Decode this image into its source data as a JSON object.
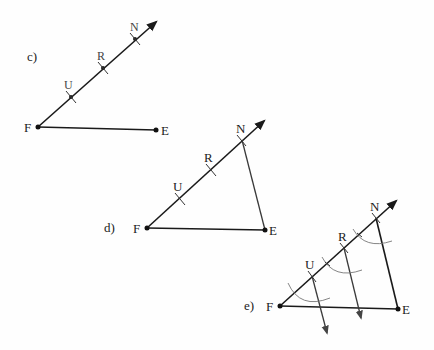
{
  "diagrams": [
    {
      "id": "c",
      "label": "c)",
      "points": {
        "F": "F",
        "E": "E",
        "U": "U",
        "R": "R",
        "N": "N"
      }
    },
    {
      "id": "d",
      "label": "d)",
      "points": {
        "F": "F",
        "E": "E",
        "U": "U",
        "R": "R",
        "N": "N"
      }
    },
    {
      "id": "e",
      "label": "e)",
      "points": {
        "F": "F",
        "E": "E",
        "U": "U",
        "R": "R",
        "N": "N"
      }
    }
  ],
  "colors": {
    "line": "#1a1a1a",
    "arc": "#777777",
    "background": "#fefefe"
  }
}
